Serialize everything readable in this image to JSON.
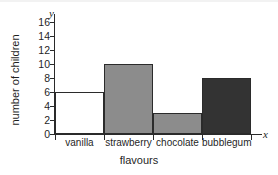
{
  "chart_data": {
    "type": "bar",
    "title": "",
    "categories": [
      "vanilla",
      "strawberry",
      "chocolate",
      "bubblegum"
    ],
    "values": [
      6,
      10,
      3,
      8
    ],
    "xlabel": "flavours",
    "ylabel": "number of children",
    "ylim": [
      0,
      16
    ],
    "ytick_values": [
      0,
      2,
      4,
      6,
      8,
      10,
      12,
      14,
      16
    ],
    "ytick_labels": [
      "0",
      "2",
      "4",
      "6",
      "8",
      "10",
      "12",
      "14",
      "16"
    ],
    "xtick_labels": [
      "vanilla",
      "strawberry",
      "chocolate",
      "bubblegum"
    ],
    "grid": false,
    "legend": false,
    "axis_letters": {
      "x": "x",
      "y": "y"
    },
    "bar_colors": [
      "#ffffff",
      "#8c8c8c",
      "#8c8c8c",
      "#333333"
    ],
    "bar_edge_color": "#2b2b2b",
    "axis_color": "#2a2a2a",
    "background": "#ffffff",
    "text_color": "#1f1f1f"
  }
}
